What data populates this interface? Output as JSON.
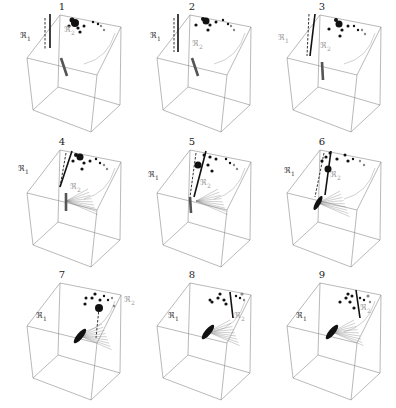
{
  "figure": {
    "colors": {
      "edge": "#8a8a8a",
      "solid": "#111111",
      "gray": "#888888",
      "light": "#bbbbbb"
    },
    "panels": [
      {
        "number": "1",
        "r1_label": "ℜ",
        "r1_sub": "1",
        "r2_label": "ℜ",
        "r2_sub": "2",
        "r1_pos": [
          20,
          32
        ],
        "r2_pos": [
          64,
          26
        ],
        "r1_gray": false,
        "r2_gray": true,
        "solid_line": [
          [
            50,
            14
          ],
          [
            50,
            48
          ]
        ],
        "dashed_line": [
          [
            45,
            18
          ],
          [
            45,
            50
          ]
        ],
        "dots": [
          [
            75,
            23,
            4
          ],
          [
            72,
            20,
            2.5
          ],
          [
            69,
            26,
            1.6
          ],
          [
            78,
            28,
            1.6
          ],
          [
            84,
            26,
            1.5
          ],
          [
            80,
            32,
            1.6
          ],
          [
            93,
            22,
            1.2
          ],
          [
            98,
            24,
            1.2
          ]
        ],
        "gray_dots": [
          [
            101,
            26,
            1.2
          ],
          [
            104,
            30,
            1.2
          ]
        ],
        "bar": [
          [
            61,
            58
          ],
          [
            67,
            76
          ]
        ],
        "fan": false,
        "ellipse": null
      },
      {
        "number": "2",
        "r1_label": "ℜ",
        "r1_sub": "1",
        "r2_label": "ℜ",
        "r2_sub": "2",
        "r1_pos": [
          20,
          32
        ],
        "r2_pos": [
          62,
          40
        ],
        "r1_gray": false,
        "r2_gray": true,
        "solid_line": [
          [
            48,
            14
          ],
          [
            48,
            52
          ]
        ],
        "dashed_line": [
          [
            44,
            18
          ],
          [
            44,
            52
          ]
        ],
        "dots": [
          [
            76,
            21,
            3.5
          ],
          [
            73,
            19,
            2
          ],
          [
            66,
            25,
            1.6
          ],
          [
            80,
            25,
            1.6
          ],
          [
            86,
            22,
            1.5
          ],
          [
            78,
            30,
            1.6
          ],
          [
            93,
            20,
            1.2
          ],
          [
            98,
            24,
            1.2
          ]
        ],
        "gray_dots": [
          [
            101,
            26,
            1.2
          ],
          [
            104,
            30,
            1.2
          ]
        ],
        "bar": [
          [
            62,
            58
          ],
          [
            68,
            76
          ]
        ],
        "fan": false,
        "ellipse": null
      },
      {
        "number": "3",
        "r1_label": "ℜ",
        "r1_sub": "1",
        "r2_label": "ℜ",
        "r2_sub": "2",
        "r1_pos": [
          18,
          34
        ],
        "r2_pos": [
          60,
          42
        ],
        "r1_gray": true,
        "r2_gray": true,
        "solid_line": [
          [
            55,
            14
          ],
          [
            50,
            56
          ]
        ],
        "dashed_line": [
          [
            49,
            14
          ],
          [
            47,
            56
          ]
        ],
        "dots": [
          [
            79,
            24,
            3.5
          ],
          [
            76,
            20,
            2
          ],
          [
            69,
            29,
            1.6
          ],
          [
            82,
            30,
            1.6
          ],
          [
            88,
            26,
            1.5
          ],
          [
            80,
            36,
            1.6
          ],
          [
            94,
            26,
            1.2
          ],
          [
            98,
            30,
            1.2
          ]
        ],
        "gray_dots": [
          [
            102,
            30,
            1.2
          ],
          [
            105,
            34,
            1.2
          ]
        ],
        "bar": [
          [
            62,
            62
          ],
          [
            63,
            80
          ]
        ],
        "fan": false,
        "ellipse": null
      },
      {
        "number": "4",
        "r1_label": "ℜ",
        "r1_sub": "1",
        "r2_label": "ℜ",
        "r2_sub": "2",
        "r1_pos": [
          18,
          30
        ],
        "r2_pos": [
          70,
          48
        ],
        "r1_gray": false,
        "r2_gray": true,
        "solid_line": [
          [
            72,
            16
          ],
          [
            60,
            52
          ]
        ],
        "dashed_line": [
          [
            66,
            18
          ],
          [
            60,
            52
          ]
        ],
        "dots": [
          [
            80,
            22,
            3.5
          ],
          [
            76,
            20,
            2
          ],
          [
            73,
            26,
            1.6
          ],
          [
            84,
            28,
            1.6
          ],
          [
            90,
            26,
            1.5
          ],
          [
            82,
            34,
            1.6
          ],
          [
            96,
            24,
            1.2
          ],
          [
            100,
            28,
            1.2
          ]
        ],
        "gray_dots": [
          [
            104,
            30,
            1.2
          ],
          [
            107,
            34,
            1.2
          ]
        ],
        "bar": [
          [
            66,
            58
          ],
          [
            66,
            76
          ]
        ],
        "fan": true,
        "ellipse": null
      },
      {
        "number": "5",
        "r1_label": "ℜ",
        "r1_sub": "1",
        "r2_label": "ℜ",
        "r2_sub": "2",
        "r1_pos": [
          18,
          36
        ],
        "r2_pos": [
          70,
          44
        ],
        "r1_gray": false,
        "r2_gray": true,
        "solid_line": [
          [
            76,
            16
          ],
          [
            64,
            62
          ]
        ],
        "dashed_line": [
          [
            66,
            18
          ],
          [
            60,
            62
          ]
        ],
        "dots": [
          [
            68,
            30,
            3.5
          ],
          [
            74,
            20,
            1.5
          ],
          [
            80,
            22,
            1.6
          ],
          [
            78,
            30,
            1.6
          ],
          [
            86,
            24,
            1.5
          ],
          [
            82,
            36,
            1.6
          ],
          [
            96,
            24,
            1.2
          ],
          [
            100,
            28,
            1.2
          ]
        ],
        "gray_dots": [
          [
            104,
            30,
            1.2
          ],
          [
            107,
            34,
            1.2
          ]
        ],
        "bar": [
          [
            60,
            62
          ],
          [
            61,
            78
          ]
        ],
        "fan": true,
        "ellipse": null
      },
      {
        "number": "6",
        "r1_label": "ℜ",
        "r1_sub": "1",
        "r2_label": "ℜ",
        "r2_sub": "2",
        "r1_pos": [
          24,
          32
        ],
        "r2_pos": [
          70,
          36
        ],
        "r1_gray": false,
        "r2_gray": true,
        "solid_line": [
          [
            71,
            16
          ],
          [
            65,
            60
          ]
        ],
        "dashed_line": [
          [
            64,
            18
          ],
          [
            55,
            62
          ]
        ],
        "dots": [
          [
            68,
            34,
            3.5
          ],
          [
            77,
            24,
            1.6
          ],
          [
            62,
            26,
            1.6
          ],
          [
            66,
            22,
            1.6
          ],
          [
            70,
            18,
            1.5
          ],
          [
            85,
            20,
            1.5
          ],
          [
            88,
            26,
            1.6
          ],
          [
            93,
            24,
            1.2
          ]
        ],
        "gray_dots": [
          [
            100,
            26,
            1.2
          ],
          [
            104,
            30,
            1.2
          ]
        ],
        "bar": null,
        "fan": true,
        "ellipse": [
          58,
          68,
          2.5,
          8,
          30
        ]
      },
      {
        "number": "7",
        "r1_label": "ℜ",
        "r1_sub": "1",
        "r2_label": "ℜ",
        "r2_sub": "2",
        "r1_pos": [
          36,
          44
        ],
        "r2_pos": [
          124,
          28
        ],
        "r1_gray": false,
        "r2_gray": true,
        "solid_line": null,
        "dashed_line": [
          [
            99,
            40
          ],
          [
            96,
            70
          ]
        ],
        "dots": [
          [
            99,
            40,
            4
          ],
          [
            85,
            36,
            1.6
          ],
          [
            92,
            30,
            1.6
          ],
          [
            95,
            26,
            1.6
          ],
          [
            86,
            30,
            1.5
          ],
          [
            100,
            32,
            1.5
          ],
          [
            104,
            28,
            1.2
          ],
          [
            108,
            32,
            1.2
          ]
        ],
        "gray_dots": [
          [
            112,
            30,
            1.2
          ],
          [
            114,
            38,
            1.2
          ]
        ],
        "bar": null,
        "fan": true,
        "ellipse": [
          80,
          68,
          3,
          9,
          40
        ]
      },
      {
        "number": "8",
        "r1_label": "ℜ",
        "r1_sub": "1",
        "r2_label": "ℜ",
        "r2_sub": "2",
        "r1_pos": [
          38,
          44
        ],
        "r2_pos": [
          104,
          44
        ],
        "r1_gray": false,
        "r2_gray": true,
        "solid_line": [
          [
            100,
            24
          ],
          [
            103,
            50
          ]
        ],
        "dashed_line": null,
        "dots": [
          [
            82,
            34,
            1.6
          ],
          [
            88,
            30,
            1.6
          ],
          [
            90,
            26,
            1.6
          ],
          [
            94,
            32,
            1.6
          ],
          [
            96,
            36,
            1.6
          ],
          [
            80,
            32,
            1.5
          ],
          [
            106,
            28,
            1.2
          ],
          [
            110,
            30,
            1.2
          ]
        ],
        "gray_dots": [
          [
            112,
            26,
            1.6
          ],
          [
            114,
            32,
            1.2
          ]
        ],
        "bar": null,
        "fan": true,
        "ellipse": [
          78,
          64,
          3,
          9,
          40
        ]
      },
      {
        "number": "9",
        "r1_label": "ℜ",
        "r1_sub": "1",
        "r2_label": "ℜ",
        "r2_sub": "2",
        "r1_pos": [
          36,
          44
        ],
        "r2_pos": [
          100,
          36
        ],
        "r1_gray": false,
        "r2_gray": true,
        "solid_line": [
          [
            96,
            22
          ],
          [
            100,
            50
          ]
        ],
        "dashed_line": null,
        "dots": [
          [
            80,
            34,
            1.6
          ],
          [
            86,
            30,
            1.6
          ],
          [
            88,
            26,
            1.6
          ],
          [
            90,
            34,
            1.6
          ],
          [
            94,
            40,
            1.6
          ],
          [
            92,
            28,
            1.5
          ],
          [
            100,
            30,
            1.2
          ],
          [
            104,
            32,
            1.2
          ]
        ],
        "gray_dots": [
          [
            108,
            28,
            1.6
          ],
          [
            110,
            34,
            1.2
          ]
        ],
        "bar": null,
        "fan": true,
        "ellipse": [
          72,
          64,
          3,
          9,
          40
        ]
      }
    ]
  }
}
